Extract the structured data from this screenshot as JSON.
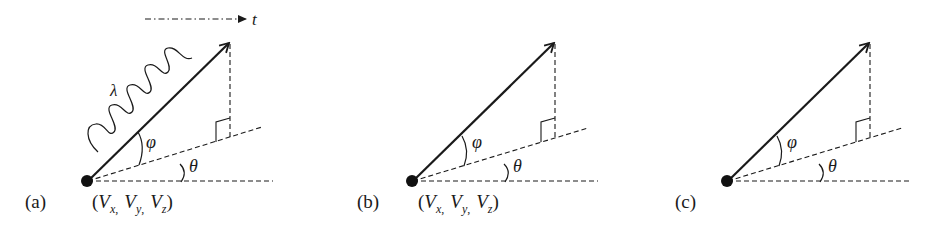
{
  "figure": {
    "panels": [
      {
        "id": "a",
        "label": "(a)",
        "coords_label": {
          "open": "(",
          "v1": "V",
          "s1": "x",
          "v2": "V",
          "s2": "y",
          "v3": "V",
          "s3": "z",
          "close": ")",
          "sep": ","
        },
        "angle_phi": "φ",
        "angle_theta": "θ",
        "wavelength": "λ",
        "time_axis": "t",
        "has_photon_wave": true,
        "has_time_arrow": true
      },
      {
        "id": "b",
        "label": "(b)",
        "coords_label": {
          "open": "(",
          "v1": "V",
          "s1": "x",
          "v2": "V",
          "s2": "y",
          "v3": "V",
          "s3": "z",
          "close": ")",
          "sep": ","
        },
        "angle_phi": "φ",
        "angle_theta": "θ",
        "has_photon_wave": false,
        "has_time_arrow": false
      },
      {
        "id": "c",
        "label": "(c)",
        "angle_phi": "φ",
        "angle_theta": "θ",
        "has_photon_wave": false,
        "has_time_arrow": false
      }
    ],
    "colors": {
      "ink": "#1a1a1a",
      "background": "#ffffff"
    }
  }
}
